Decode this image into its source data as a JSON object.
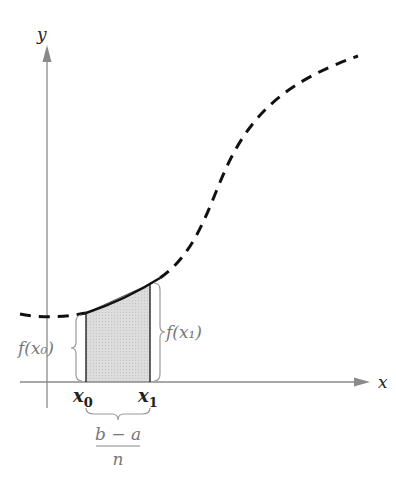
{
  "diagram": {
    "type": "riemann-sum-first-subinterval",
    "axes": {
      "x_label": "x",
      "y_label": "y"
    },
    "points": {
      "x0_label": "x",
      "x0_sub": "0",
      "x1_label": "x",
      "x1_sub": "1"
    },
    "heights": {
      "left": "f(x₀)",
      "right": "f(x₁)"
    },
    "width_label": {
      "numerator": "b − a",
      "denominator": "n"
    },
    "colors": {
      "curve": "#111111",
      "axis": "#888888",
      "shading": "#d6d6d6",
      "brace": "#999999",
      "label_gray": "#777777"
    }
  }
}
